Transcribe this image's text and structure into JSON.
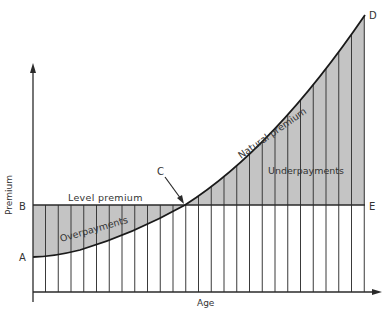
{
  "diagram": {
    "y_axis_label": "Premium",
    "x_axis_label": "Age",
    "points": {
      "A": {
        "label": "A"
      },
      "B": {
        "label": "B"
      },
      "C": {
        "label": "C"
      },
      "D": {
        "label": "D"
      },
      "E": {
        "label": "E"
      }
    },
    "curves": {
      "level_premium": "Level premium",
      "natural_premium": "Natural premium"
    },
    "regions": {
      "overpayments": "Overpayments",
      "underpayments": "Underpayments"
    },
    "colors": {
      "shade": "#c4c4c4",
      "line": "#2a2a2a",
      "text": "#333333"
    }
  }
}
